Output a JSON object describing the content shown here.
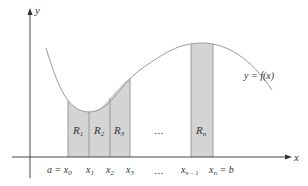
{
  "diagram": {
    "axes": {
      "x_label": "x",
      "y_label": "y"
    },
    "curve_label": "y = f(x)",
    "strips": [
      {
        "label": "R",
        "sub": "1"
      },
      {
        "label": "R",
        "sub": "2"
      },
      {
        "label": "R",
        "sub": "3"
      },
      {
        "label": "R",
        "sub": "n"
      }
    ],
    "ellipsis_region": "...",
    "ellipsis_axis": "...",
    "ticks": [
      {
        "pre": "a = ",
        "var": "x",
        "sub": "0",
        "post": ""
      },
      {
        "pre": "",
        "var": "x",
        "sub": "1",
        "post": ""
      },
      {
        "pre": "",
        "var": "x",
        "sub": "2",
        "post": ""
      },
      {
        "pre": "",
        "var": "x",
        "sub": "3",
        "post": ""
      },
      {
        "pre": "",
        "var": "x",
        "sub": "n − 1",
        "post": ""
      },
      {
        "pre": "",
        "var": "x",
        "sub": "n",
        "post": " = b"
      }
    ],
    "colors": {
      "strip_fill": "#d4d4d4",
      "curve": "#9a9a9a",
      "axis": "#333333"
    }
  }
}
